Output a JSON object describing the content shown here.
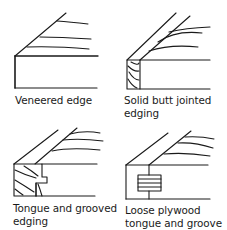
{
  "figures": [
    {
      "id": "veneered",
      "label_lines": [
        "Veneered edge"
      ]
    },
    {
      "id": "solid-butt",
      "label_lines": [
        "Solid butt jointed",
        "edging"
      ]
    },
    {
      "id": "tongue-groove",
      "label_lines": [
        "Tongue and grooved",
        "edging"
      ]
    },
    {
      "id": "loose-plywood",
      "label_lines": [
        "Loose plywood",
        "tongue and groove"
      ]
    }
  ],
  "colors": {
    "ink": "#1a1a1a",
    "background": "#ffffff"
  }
}
